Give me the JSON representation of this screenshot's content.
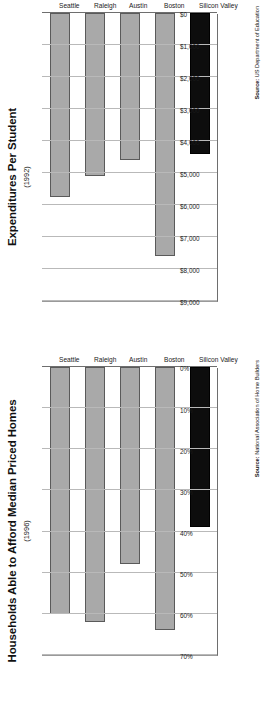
{
  "page": {
    "background": "#ffffff",
    "orientation": "charts rotated 90 degrees counter-clockwise"
  },
  "palette": {
    "bar_gray": "#a9a9a9",
    "bar_highlight": "#0d0d0d",
    "gridline": "#b9b9b9",
    "axis": "#6e6e6e",
    "text": "#1b1b1b"
  },
  "charts": [
    {
      "id": "expenditures-per-student",
      "title": "Expenditures Per Student",
      "subtitle": "(1992)",
      "source_label": "Source:",
      "source_text": "US Department of Education",
      "source_full": "Source: US Department of Education"
    },
    {
      "id": "households-afford-median-homes",
      "title": "Households Able to Afford Median Priced Homes",
      "subtitle": "(1996)",
      "source_label": "Source:",
      "source_text": "National Association of Home Builders",
      "source_full": "Source: National Association of Home Builders"
    }
  ],
  "chart_data": [
    {
      "type": "bar",
      "orientation": "horizontal",
      "title": "Expenditures Per Student",
      "subtitle": "(1992)",
      "xlabel": "",
      "ylabel": "",
      "categories": [
        "Silicon Valley",
        "Boston",
        "Austin",
        "Raleigh",
        "Seattle"
      ],
      "values": [
        4400,
        7600,
        4600,
        5100,
        5750
      ],
      "value_axis_ticks": [
        "$9,000",
        "$8,000",
        "$7,000",
        "$6,000",
        "$5,000",
        "$4,000",
        "$3,000",
        "$2,000",
        "$1,000",
        "$0"
      ],
      "value_axis_tick_numbers": [
        9000,
        8000,
        7000,
        6000,
        5000,
        4000,
        3000,
        2000,
        1000,
        0
      ],
      "xlim": [
        0,
        9000
      ],
      "grid": true,
      "legend": "none",
      "highlight_category": "Silicon Valley",
      "highlight_color": "#0d0d0d",
      "series_color": "#a9a9a9",
      "source": "Source: US Department of Education"
    },
    {
      "type": "bar",
      "orientation": "horizontal",
      "title": "Households Able to Afford Median Priced Homes",
      "subtitle": "(1996)",
      "xlabel": "",
      "ylabel": "",
      "categories": [
        "Silicon Valley",
        "Boston",
        "Austin",
        "Raleigh",
        "Seattle"
      ],
      "values": [
        39,
        64,
        48,
        62,
        60
      ],
      "value_axis_ticks": [
        "70%",
        "60%",
        "50%",
        "40%",
        "30%",
        "20%",
        "10%",
        "0%"
      ],
      "value_axis_tick_numbers": [
        70,
        60,
        50,
        40,
        30,
        20,
        10,
        0
      ],
      "xlim": [
        0,
        70
      ],
      "grid": true,
      "legend": "none",
      "highlight_category": "Silicon Valley",
      "highlight_color": "#0d0d0d",
      "series_color": "#a9a9a9",
      "source": "Source: National Association of Home Builders"
    }
  ]
}
